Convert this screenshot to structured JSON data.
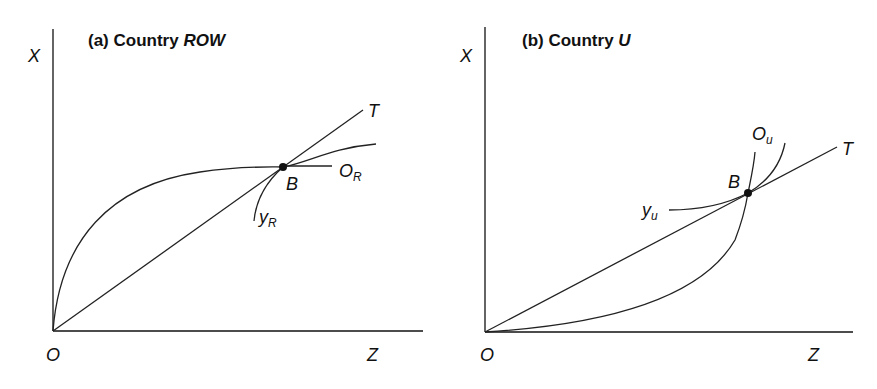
{
  "panels": [
    {
      "id": "a",
      "title_prefix": "(a) Country ",
      "title_country": "ROW",
      "axis_y_label": "X",
      "axis_x_label": "Z",
      "origin_label": "O",
      "ray_label": "T",
      "point_label": "B",
      "offer_curve_label": "O",
      "offer_curve_sub": "R",
      "indiff_label": "y",
      "indiff_sub": "R"
    },
    {
      "id": "b",
      "title_prefix": "(b) Country ",
      "title_country": "U",
      "axis_y_label": "X",
      "axis_x_label": "Z",
      "origin_label": "O",
      "ray_label": "T",
      "point_label": "B",
      "offer_curve_label": "O",
      "offer_curve_sub": "u",
      "indiff_label": "y",
      "indiff_sub": "u"
    }
  ],
  "colors": {
    "line": "#222222",
    "text": "#111111",
    "background": "#ffffff"
  }
}
